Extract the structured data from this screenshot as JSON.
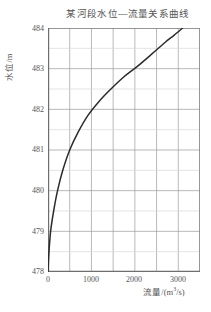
{
  "chart_data": {
    "type": "line",
    "title": "某河段水位—流量关系曲线",
    "xlabel_text": "流量/(m",
    "xlabel_sup": "3",
    "xlabel_tail": "/s)",
    "xlabel_full": "流量/(m3/s)",
    "ylabel": "水位/m",
    "xlim": [
      0,
      3500
    ],
    "ylim": [
      478,
      484
    ],
    "grid": true,
    "grid_major_x": 1000,
    "grid_minor_x": 500,
    "grid_major_y": 1,
    "grid_minor_y": 0.5,
    "legend": "none",
    "xticks": [
      {
        "value": 0,
        "label": "0"
      },
      {
        "value": 1000,
        "label": "1000"
      },
      {
        "value": 2000,
        "label": "2000"
      },
      {
        "value": 3000,
        "label": "3000"
      }
    ],
    "yticks": [
      {
        "value": 484,
        "label": "484"
      },
      {
        "value": 483,
        "label": "483"
      },
      {
        "value": 482,
        "label": "482"
      },
      {
        "value": 481,
        "label": "481"
      },
      {
        "value": 480,
        "label": "480"
      },
      {
        "value": 479,
        "label": "479"
      },
      {
        "value": 478,
        "label": "478"
      }
    ],
    "series": [
      {
        "name": "水位—流量关系曲线",
        "color": "#2b2b2b",
        "x": [
          0,
          20,
          60,
          130,
          220,
          340,
          500,
          700,
          920,
          1180,
          1450,
          1750,
          2050,
          2380,
          2700,
          2900,
          3100
        ],
        "y": [
          478.0,
          478.45,
          479.0,
          479.5,
          480.0,
          480.5,
          481.0,
          481.45,
          481.85,
          482.2,
          482.5,
          482.8,
          483.05,
          483.35,
          483.65,
          483.82,
          484.0
        ]
      }
    ]
  },
  "style": {
    "curve_color": "#2b2b2b",
    "axis_color": "#808080",
    "grid_major_color": "#999999",
    "grid_minor_color": "#d8d8d8",
    "text_color": "#555555",
    "background": "#ffffff"
  }
}
